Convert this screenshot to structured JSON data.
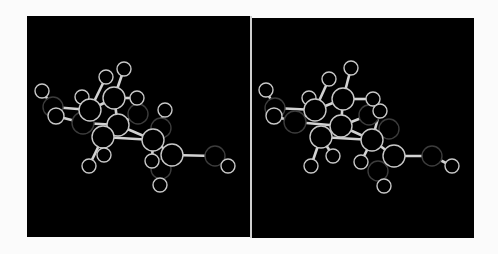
{
  "figure": {
    "type": "stereo-pair ball-and-stick molecular model",
    "background_color": "#fbfbfb",
    "panel_color": "#000000",
    "divider_color": "#cfcfcf",
    "bond_color": "#d2d2d2",
    "atom_outline_bright": "#c8c8c8",
    "atom_outline_dim": "#3c3c3c"
  },
  "panels": [
    {
      "id": "left",
      "atoms": [
        {
          "x": 15,
          "y": 75,
          "r": 7,
          "dim": false
        },
        {
          "x": 26,
          "y": 91,
          "r": 10,
          "dim": true
        },
        {
          "x": 29,
          "y": 100,
          "r": 8,
          "dim": false
        },
        {
          "x": 55,
          "y": 81,
          "r": 7,
          "dim": false
        },
        {
          "x": 63,
          "y": 94,
          "r": 11,
          "dim": false
        },
        {
          "x": 56,
          "y": 107,
          "r": 11,
          "dim": true
        },
        {
          "x": 79,
          "y": 61,
          "r": 7,
          "dim": false
        },
        {
          "x": 97,
          "y": 53,
          "r": 7,
          "dim": false
        },
        {
          "x": 87,
          "y": 82,
          "r": 11,
          "dim": false
        },
        {
          "x": 110,
          "y": 82,
          "r": 7,
          "dim": false
        },
        {
          "x": 111,
          "y": 98,
          "r": 10,
          "dim": true
        },
        {
          "x": 91,
          "y": 109,
          "r": 11,
          "dim": false
        },
        {
          "x": 76,
          "y": 121,
          "r": 11,
          "dim": false
        },
        {
          "x": 77,
          "y": 139,
          "r": 7,
          "dim": false
        },
        {
          "x": 62,
          "y": 150,
          "r": 7,
          "dim": false
        },
        {
          "x": 138,
          "y": 94,
          "r": 7,
          "dim": false
        },
        {
          "x": 134,
          "y": 112,
          "r": 10,
          "dim": true
        },
        {
          "x": 126,
          "y": 124,
          "r": 11,
          "dim": false
        },
        {
          "x": 145,
          "y": 139,
          "r": 11,
          "dim": false
        },
        {
          "x": 125,
          "y": 145,
          "r": 7,
          "dim": false
        },
        {
          "x": 134,
          "y": 153,
          "r": 10,
          "dim": true
        },
        {
          "x": 133,
          "y": 169,
          "r": 7,
          "dim": false
        },
        {
          "x": 188,
          "y": 140,
          "r": 10,
          "dim": true
        },
        {
          "x": 201,
          "y": 150,
          "r": 7,
          "dim": false
        }
      ],
      "bonds": [
        [
          0,
          1
        ],
        [
          1,
          4
        ],
        [
          2,
          5
        ],
        [
          3,
          4
        ],
        [
          4,
          6
        ],
        [
          4,
          8
        ],
        [
          4,
          5
        ],
        [
          5,
          11
        ],
        [
          7,
          8
        ],
        [
          8,
          9
        ],
        [
          8,
          11
        ],
        [
          11,
          10
        ],
        [
          11,
          12
        ],
        [
          12,
          13
        ],
        [
          12,
          14
        ],
        [
          11,
          17
        ],
        [
          12,
          17
        ],
        [
          17,
          15
        ],
        [
          17,
          16
        ],
        [
          17,
          18
        ],
        [
          17,
          19
        ],
        [
          18,
          20
        ],
        [
          20,
          21
        ],
        [
          18,
          22
        ],
        [
          22,
          23
        ]
      ]
    },
    {
      "id": "right",
      "atoms": [
        {
          "x": 14,
          "y": 72,
          "r": 7,
          "dim": false
        },
        {
          "x": 23,
          "y": 90,
          "r": 10,
          "dim": true
        },
        {
          "x": 22,
          "y": 98,
          "r": 8,
          "dim": false
        },
        {
          "x": 57,
          "y": 80,
          "r": 7,
          "dim": false
        },
        {
          "x": 63,
          "y": 92,
          "r": 11,
          "dim": false
        },
        {
          "x": 43,
          "y": 104,
          "r": 11,
          "dim": true
        },
        {
          "x": 77,
          "y": 61,
          "r": 7,
          "dim": false
        },
        {
          "x": 99,
          "y": 50,
          "r": 7,
          "dim": false
        },
        {
          "x": 91,
          "y": 81,
          "r": 11,
          "dim": false
        },
        {
          "x": 121,
          "y": 81,
          "r": 7,
          "dim": false
        },
        {
          "x": 117,
          "y": 97,
          "r": 10,
          "dim": true
        },
        {
          "x": 89,
          "y": 108,
          "r": 11,
          "dim": false
        },
        {
          "x": 69,
          "y": 119,
          "r": 11,
          "dim": false
        },
        {
          "x": 81,
          "y": 138,
          "r": 7,
          "dim": false
        },
        {
          "x": 59,
          "y": 148,
          "r": 7,
          "dim": false
        },
        {
          "x": 128,
          "y": 93,
          "r": 7,
          "dim": false
        },
        {
          "x": 137,
          "y": 111,
          "r": 10,
          "dim": true
        },
        {
          "x": 120,
          "y": 122,
          "r": 11,
          "dim": false
        },
        {
          "x": 142,
          "y": 138,
          "r": 11,
          "dim": false
        },
        {
          "x": 109,
          "y": 144,
          "r": 7,
          "dim": false
        },
        {
          "x": 126,
          "y": 153,
          "r": 10,
          "dim": true
        },
        {
          "x": 132,
          "y": 168,
          "r": 7,
          "dim": false
        },
        {
          "x": 180,
          "y": 138,
          "r": 10,
          "dim": true
        },
        {
          "x": 200,
          "y": 148,
          "r": 7,
          "dim": false
        }
      ],
      "bonds": [
        [
          0,
          1
        ],
        [
          1,
          4
        ],
        [
          2,
          5
        ],
        [
          3,
          4
        ],
        [
          4,
          6
        ],
        [
          4,
          8
        ],
        [
          4,
          5
        ],
        [
          5,
          11
        ],
        [
          7,
          8
        ],
        [
          8,
          9
        ],
        [
          8,
          11
        ],
        [
          11,
          10
        ],
        [
          11,
          12
        ],
        [
          12,
          13
        ],
        [
          12,
          14
        ],
        [
          11,
          17
        ],
        [
          12,
          17
        ],
        [
          17,
          15
        ],
        [
          17,
          16
        ],
        [
          17,
          18
        ],
        [
          17,
          19
        ],
        [
          18,
          20
        ],
        [
          20,
          21
        ],
        [
          18,
          22
        ],
        [
          22,
          23
        ]
      ]
    }
  ]
}
